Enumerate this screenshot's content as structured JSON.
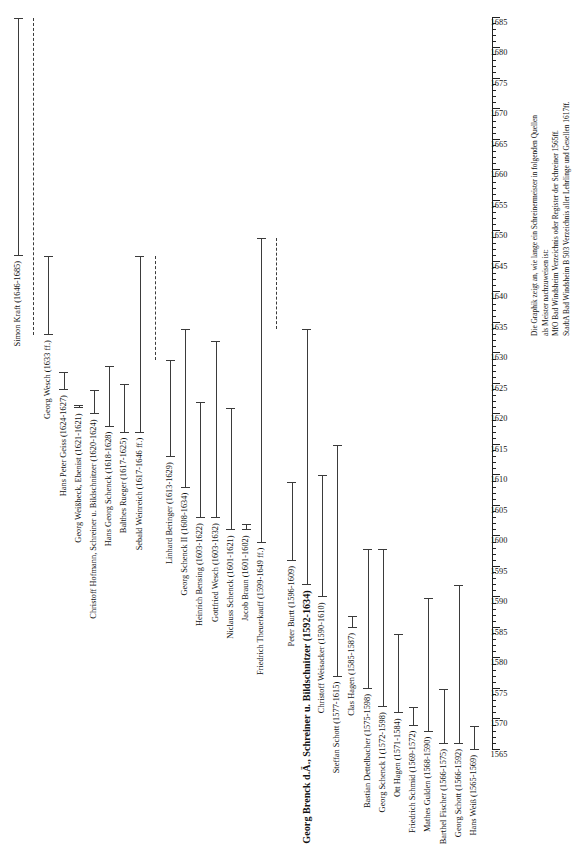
{
  "chart_data": {
    "type": "bar",
    "orientation": "horizontal-rotated",
    "title": "",
    "xlabel": "",
    "ylabel": "",
    "xlim": [
      1565,
      1685
    ],
    "tick_step": 5,
    "minor_tick_step": 1,
    "grid": false,
    "legend": null,
    "axis_ticks": [
      "1565",
      "1570",
      "1575",
      "1580",
      "1585",
      "1590",
      "1595",
      "1600",
      "1605",
      "1610",
      "1615",
      "1620",
      "1625",
      "1630",
      "1635",
      "1640",
      "1645",
      "1650",
      "1655",
      "1660",
      "1665",
      "1670",
      "1675",
      "1680",
      "1685"
    ],
    "categories": [
      "Simon Kraft (1646-1685)",
      "Georg Wesch (1633 ff.)",
      "Hans Peter Geiss (1624-1627)",
      "Georg Weißbeck, Ebenist (1621-1621)",
      "Christoff Hofmann, Schreiner u. Bildschnitzer (1620-1624)",
      "Hans Georg Schenck (1618-1628)",
      "Balthes Rueger (1617-1625)",
      "Sebald Weinreich (1617-1646 ff.)",
      "Linhard Beringer (1613-1629)",
      "Georg Schenck II (1608-1634)",
      "Heinrich Bensing (1603-1622)",
      "Gottfried Wesch (1603-1632)",
      "Niclauss Schenck (1601-1621)",
      "Jacob Braun (1601-1602)",
      "Friedrich Theuerkauff (1599-1649 ff.)",
      "Peter Burtt (1596-1609)",
      "Georg Brenck d.Ä., Schreiner u. Bildschnitzer  (1592-1634)",
      "Christoff Weisacker (1590-1610)",
      "Steffan Schott (1577-1615)",
      "Clas Hagen (1585-1587)",
      "Bastian Dettelbacher (1575-1598)",
      "Georg Schenck I (1572-1598)",
      "Ott Hagen (1571-1584)",
      "Friedrich Schmid (1569-1572)",
      "Mathes Gulden (1568-1590)",
      "Barthel Fischer (1566-1575)",
      "Georg Schott (1566-1592)",
      "Hans Weiß (1565-1569)"
    ],
    "bars": [
      {
        "label": "Simon Kraft (1646-1685)",
        "start": 1646,
        "end": 1685,
        "style": "solid",
        "emphasis": "normal"
      },
      {
        "label": "",
        "start": 1633,
        "end": 1685,
        "style": "dashed",
        "emphasis": "normal"
      },
      {
        "label": "Georg Wesch (1633 ff.)",
        "start": 1633,
        "end": 1646,
        "style": "solid",
        "emphasis": "normal"
      },
      {
        "label": "Hans Peter Geiss (1624-1627)",
        "start": 1624,
        "end": 1627,
        "style": "solid",
        "emphasis": "normal"
      },
      {
        "label": "Georg Weißbeck, Ebenist (1621-1621)",
        "start": 1621,
        "end": 1621.6,
        "style": "solid",
        "emphasis": "normal"
      },
      {
        "label": "Christoff Hofmann, Schreiner u. Bildschnitzer (1620-1624)",
        "start": 1620,
        "end": 1624,
        "style": "solid",
        "emphasis": "normal"
      },
      {
        "label": "Hans Georg Schenck (1618-1628)",
        "start": 1618,
        "end": 1628,
        "style": "solid",
        "emphasis": "normal"
      },
      {
        "label": "Balthes Rueger (1617-1625)",
        "start": 1617,
        "end": 1625,
        "style": "solid",
        "emphasis": "normal"
      },
      {
        "label": "Sebald Weinreich (1617-1646 ff.)",
        "start": 1617,
        "end": 1646,
        "style": "solid",
        "emphasis": "normal"
      },
      {
        "label": "",
        "start": 1629,
        "end": 1646,
        "style": "dashed",
        "emphasis": "normal"
      },
      {
        "label": "Linhard Beringer (1613-1629)",
        "start": 1613,
        "end": 1629,
        "style": "solid",
        "emphasis": "normal"
      },
      {
        "label": "Georg Schenck II (1608-1634)",
        "start": 1608,
        "end": 1634,
        "style": "solid",
        "emphasis": "normal"
      },
      {
        "label": "Heinrich Bensing (1603-1622)",
        "start": 1603,
        "end": 1622,
        "style": "solid",
        "emphasis": "normal"
      },
      {
        "label": "Gottfried Wesch (1603-1632)",
        "start": 1603,
        "end": 1632,
        "style": "solid",
        "emphasis": "normal"
      },
      {
        "label": "Niclauss Schenck (1601-1621)",
        "start": 1601,
        "end": 1621,
        "style": "solid",
        "emphasis": "normal"
      },
      {
        "label": "Jacob Braun (1601-1602)",
        "start": 1601,
        "end": 1602,
        "style": "solid",
        "emphasis": "normal"
      },
      {
        "label": "Friedrich Theuerkauff (1599-1649 ff.)",
        "start": 1599,
        "end": 1649,
        "style": "solid",
        "emphasis": "normal"
      },
      {
        "label": "",
        "start": 1634,
        "end": 1649,
        "style": "dashed",
        "emphasis": "normal"
      },
      {
        "label": "Peter Burtt (1596-1609)",
        "start": 1596,
        "end": 1609,
        "style": "solid",
        "emphasis": "normal"
      },
      {
        "label": "Georg Brenck d.Ä., Schreiner u. Bildschnitzer  (1592-1634)",
        "start": 1592,
        "end": 1634,
        "style": "solid",
        "emphasis": "big"
      },
      {
        "label": "Christoff Weisacker (1590-1610)",
        "start": 1590,
        "end": 1610,
        "style": "solid",
        "emphasis": "normal"
      },
      {
        "label": "Steffan Schott (1577-1615)",
        "start": 1577,
        "end": 1615,
        "style": "solid",
        "emphasis": "normal"
      },
      {
        "label": "Clas Hagen (1585-1587)",
        "start": 1585,
        "end": 1587,
        "style": "solid",
        "emphasis": "normal"
      },
      {
        "label": "Bastian Dettelbacher (1575-1598)",
        "start": 1575,
        "end": 1598,
        "style": "solid",
        "emphasis": "normal"
      },
      {
        "label": "Georg Schenck I (1572-1598)",
        "start": 1572,
        "end": 1598,
        "style": "solid",
        "emphasis": "normal"
      },
      {
        "label": "Ott Hagen (1571-1584)",
        "start": 1571,
        "end": 1584,
        "style": "solid",
        "emphasis": "normal"
      },
      {
        "label": "Friedrich Schmid (1569-1572)",
        "start": 1569,
        "end": 1572,
        "style": "solid",
        "emphasis": "normal"
      },
      {
        "label": "Mathes Gulden (1568-1590)",
        "start": 1568,
        "end": 1590,
        "style": "solid",
        "emphasis": "normal"
      },
      {
        "label": "Barthel Fischer (1566-1575)",
        "start": 1566,
        "end": 1575,
        "style": "solid",
        "emphasis": "normal"
      },
      {
        "label": "Georg Schott (1566-1592)",
        "start": 1566,
        "end": 1592,
        "style": "solid",
        "emphasis": "normal"
      },
      {
        "label": "Hans Weiß (1565-1569)",
        "start": 1565,
        "end": 1569,
        "style": "solid",
        "emphasis": "normal"
      }
    ]
  },
  "caption": {
    "lines": [
      "Die Graphik zeigt an, wie lange ein Schreinermeister in folgenden Quellen",
      "als Meister nachzuweisen ist:",
      "MfO Bad Windsheim Verzeichnis oder Register der Schreiner 1565ff.",
      "StadtA Bad Windsheim B 503 Verzeichnis aller Lehrlinge und Gesellen 1617ff."
    ]
  },
  "colors": {
    "bar": "#3b3b3b",
    "axis": "#222222",
    "text": "#111111",
    "background": "#ffffff"
  }
}
